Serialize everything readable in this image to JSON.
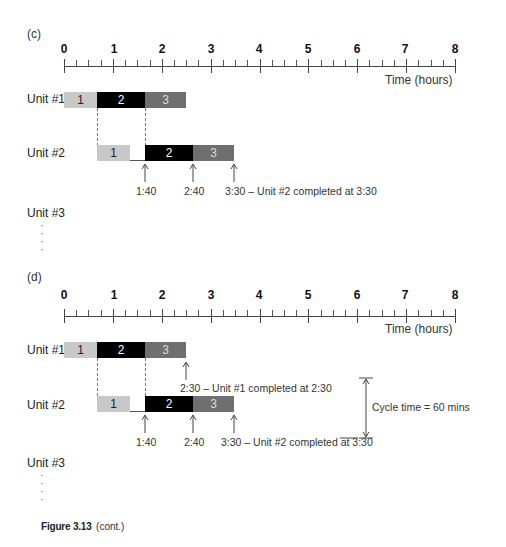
{
  "figure": {
    "caption_label": "Figure 3.13",
    "caption_suffix": "(cont.)"
  },
  "axis": {
    "ticks": [
      "0",
      "1",
      "2",
      "3",
      "4",
      "5",
      "6",
      "7",
      "8"
    ],
    "title": "Time (hours)",
    "minor_per_hour": 4
  },
  "colors": {
    "step1": "#c8c8c8",
    "step2": "#000000",
    "step3": "#6f6f6f"
  },
  "panels": [
    {
      "label": "(c)",
      "units": [
        {
          "label": "Unit #1",
          "segments": [
            {
              "text": "1",
              "start": 0,
              "end": 0.6667
            },
            {
              "text": "2",
              "start": 0.6667,
              "end": 1.6667
            },
            {
              "text": "3",
              "start": 1.6667,
              "end": 2.5
            }
          ]
        },
        {
          "label": "Unit #2",
          "segments": [
            {
              "text": "1",
              "start": 0.6667,
              "end": 1.3333
            },
            {
              "text": "2",
              "start": 1.6667,
              "end": 2.6667
            },
            {
              "text": "3",
              "start": 2.6667,
              "end": 3.5
            }
          ]
        },
        {
          "label": "Unit #3"
        }
      ],
      "annotations": [
        "1:40",
        "2:40",
        "3:30 – Unit #2 completed at 3:30"
      ]
    },
    {
      "label": "(d)",
      "units": [
        {
          "label": "Unit #1",
          "segments": [
            {
              "text": "1",
              "start": 0,
              "end": 0.6667
            },
            {
              "text": "2",
              "start": 0.6667,
              "end": 1.6667
            },
            {
              "text": "3",
              "start": 1.6667,
              "end": 2.5
            }
          ]
        },
        {
          "label": "Unit #2",
          "segments": [
            {
              "text": "1",
              "start": 0.6667,
              "end": 1.3333
            },
            {
              "text": "2",
              "start": 1.6667,
              "end": 2.6667
            },
            {
              "text": "3",
              "start": 2.6667,
              "end": 3.5
            }
          ]
        },
        {
          "label": "Unit #3"
        }
      ],
      "unit1_annotation": "2:30 – Unit #1 completed at 2:30",
      "annotations": [
        "1:40",
        "2:40",
        "3:30 – Unit #2 completed at 3:30"
      ],
      "cycle_time_label": "Cycle time = 60 mins"
    }
  ]
}
